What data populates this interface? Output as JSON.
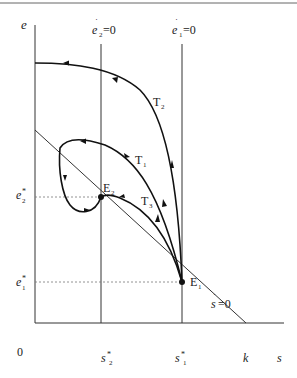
{
  "figure": {
    "type": "phase-diagram",
    "axes": {
      "y_label": "e",
      "x_label": "s",
      "origin_label": "0"
    },
    "isoclines": [
      {
        "id": "e2dot",
        "label_base": "e",
        "label_sub": "2",
        "label_eq": "=0"
      },
      {
        "id": "e1dot",
        "label_base": "e",
        "label_sub": "1",
        "label_eq": "=0"
      },
      {
        "id": "sdot",
        "label_base": "s",
        "label_eq": "=0"
      }
    ],
    "y_ticks": [
      {
        "id": "e2star",
        "base": "e",
        "sub": "2",
        "sup": "*"
      },
      {
        "id": "e1star",
        "base": "e",
        "sub": "1",
        "sup": "*"
      }
    ],
    "x_ticks": [
      {
        "id": "s2star",
        "base": "s",
        "sub": "2",
        "sup": "*"
      },
      {
        "id": "s1star",
        "base": "s",
        "sub": "1",
        "sup": "*"
      },
      {
        "id": "k",
        "base": "k"
      }
    ],
    "equilibria": [
      {
        "id": "E2",
        "base": "E",
        "sub": "2"
      },
      {
        "id": "E1",
        "base": "E",
        "sub": "1"
      }
    ],
    "trajectories": [
      {
        "id": "T2",
        "base": "T",
        "sub": "2"
      },
      {
        "id": "T1",
        "base": "T",
        "sub": "1"
      },
      {
        "id": "T3",
        "base": "T",
        "sub": "3"
      }
    ]
  }
}
